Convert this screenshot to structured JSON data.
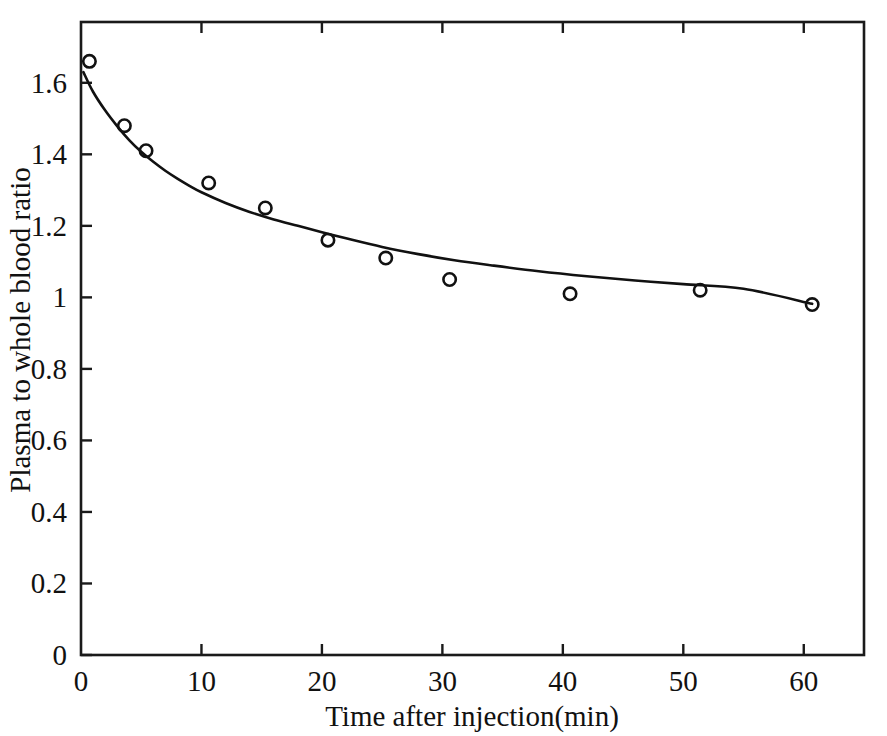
{
  "chart_data": {
    "type": "scatter",
    "title": "",
    "subtitle": "",
    "xlabel": "Time after injection(min)",
    "ylabel": "Plasma to whole blood ratio",
    "xlim": [
      0,
      65
    ],
    "ylim": [
      0,
      1.77
    ],
    "xticks": [
      0,
      10,
      20,
      30,
      40,
      50,
      60
    ],
    "xtick_labels": [
      "0",
      "10",
      "20",
      "30",
      "40",
      "50",
      "60"
    ],
    "yticks": [
      0,
      0.2,
      0.4,
      0.6,
      0.8,
      1,
      1.2,
      1.4,
      1.6
    ],
    "ytick_labels": [
      "0",
      "0.2",
      "0.4",
      "0.6",
      "0.8",
      "1",
      "1.2",
      "1.4",
      "1.6"
    ],
    "grid": false,
    "legend": "none",
    "series": [
      {
        "name": "Measured plasma to whole blood ratio",
        "marker": "open-circle",
        "marker_color": "#111111",
        "x": [
          0.7,
          3.6,
          5.4,
          10.6,
          15.3,
          20.5,
          25.3,
          30.6,
          40.6,
          51.4,
          60.7
        ],
        "values": [
          1.66,
          1.48,
          1.41,
          1.32,
          1.25,
          1.16,
          1.11,
          1.05,
          1.01,
          1.02,
          0.98
        ]
      },
      {
        "name": "Fitted exponential decay curve",
        "marker": "none",
        "line_color": "#111111",
        "x": [
          0.2,
          1,
          2,
          3,
          4,
          5,
          6,
          7,
          8,
          9,
          10,
          12,
          14,
          16,
          18,
          20,
          22,
          25,
          28,
          31,
          34,
          38,
          42,
          46,
          50,
          55,
          60.7
        ],
        "values": [
          1.63,
          1.575,
          1.523,
          1.479,
          1.44,
          1.407,
          1.379,
          1.354,
          1.332,
          1.312,
          1.294,
          1.264,
          1.239,
          1.218,
          1.2,
          1.182,
          1.165,
          1.141,
          1.121,
          1.104,
          1.09,
          1.073,
          1.059,
          1.047,
          1.037,
          1.024,
          0.982
        ]
      }
    ]
  },
  "axis_colors": {
    "axis": "#1a1a1a",
    "data": "#111111",
    "background": "#ffffff"
  }
}
